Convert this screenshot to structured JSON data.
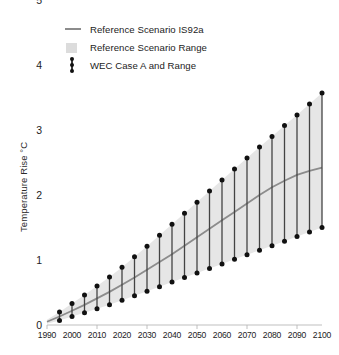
{
  "chart_data": {
    "type": "line",
    "title": "",
    "xlabel": "",
    "ylabel": "Temperature Rise °C",
    "xlim": [
      1990,
      2100
    ],
    "ylim": [
      0,
      5
    ],
    "grid": false,
    "legend_position": "top-left",
    "y_ticks": [
      "0",
      "1",
      "2",
      "3",
      "4",
      "5"
    ],
    "y_tick_values": [
      0,
      1,
      2,
      3,
      4,
      5
    ],
    "x_ticks": [
      "1990",
      "2000",
      "2010",
      "2020",
      "2030",
      "2040",
      "2050",
      "2060",
      "2070",
      "2080",
      "2090",
      "2100"
    ],
    "x_tick_values": [
      1990,
      2000,
      2010,
      2020,
      2030,
      2040,
      2050,
      2060,
      2070,
      2080,
      2090,
      2100
    ],
    "series": [
      {
        "name": "Reference Scenario IS92a",
        "type": "line",
        "color": "#8c8c8c",
        "x": [
          1990,
          1995,
          2000,
          2005,
          2010,
          2015,
          2020,
          2025,
          2030,
          2035,
          2040,
          2045,
          2050,
          2055,
          2060,
          2065,
          2070,
          2075,
          2080,
          2085,
          2090,
          2095,
          2100
        ],
        "values": [
          0.05,
          0.13,
          0.22,
          0.31,
          0.41,
          0.51,
          0.62,
          0.73,
          0.85,
          0.97,
          1.09,
          1.22,
          1.35,
          1.48,
          1.61,
          1.74,
          1.87,
          2.0,
          2.12,
          2.22,
          2.31,
          2.37,
          2.42
        ]
      },
      {
        "name": "Reference Scenario Range",
        "type": "band",
        "color": "#e6e6e6",
        "x": [
          1990,
          1995,
          2000,
          2005,
          2010,
          2015,
          2020,
          2025,
          2030,
          2035,
          2040,
          2045,
          2050,
          2055,
          2060,
          2065,
          2070,
          2075,
          2080,
          2085,
          2090,
          2095,
          2100
        ],
        "lower": [
          0.02,
          0.07,
          0.13,
          0.19,
          0.25,
          0.31,
          0.38,
          0.45,
          0.52,
          0.59,
          0.66,
          0.73,
          0.8,
          0.87,
          0.94,
          1.01,
          1.08,
          1.15,
          1.22,
          1.29,
          1.36,
          1.43,
          1.5
        ],
        "upper": [
          0.08,
          0.2,
          0.33,
          0.46,
          0.6,
          0.74,
          0.89,
          1.05,
          1.21,
          1.38,
          1.55,
          1.72,
          1.89,
          2.06,
          2.23,
          2.4,
          2.57,
          2.74,
          2.9,
          3.07,
          3.23,
          3.4,
          3.57
        ]
      },
      {
        "name": "WEC Case A and Range",
        "type": "errorbar",
        "color": "#111111",
        "x": [
          1995,
          2000,
          2005,
          2010,
          2015,
          2020,
          2025,
          2030,
          2035,
          2040,
          2045,
          2050,
          2055,
          2060,
          2065,
          2070,
          2075,
          2080,
          2085,
          2090,
          2095,
          2100
        ],
        "lower": [
          0.07,
          0.13,
          0.19,
          0.25,
          0.31,
          0.38,
          0.45,
          0.52,
          0.59,
          0.66,
          0.73,
          0.8,
          0.87,
          0.94,
          1.01,
          1.08,
          1.15,
          1.22,
          1.29,
          1.36,
          1.43,
          1.5
        ],
        "upper": [
          0.2,
          0.33,
          0.46,
          0.6,
          0.74,
          0.89,
          1.05,
          1.21,
          1.38,
          1.55,
          1.72,
          1.89,
          2.06,
          2.23,
          2.4,
          2.57,
          2.74,
          2.9,
          3.07,
          3.23,
          3.4,
          3.57
        ]
      }
    ],
    "legend": [
      {
        "label": "Reference Scenario IS92a",
        "marker": "line",
        "color": "#8c8c8c"
      },
      {
        "label": "Reference Scenario Range",
        "marker": "square",
        "color": "#dcdcdc"
      },
      {
        "label": "WEC Case A and Range",
        "marker": "errorbar",
        "color": "#111111"
      }
    ]
  }
}
